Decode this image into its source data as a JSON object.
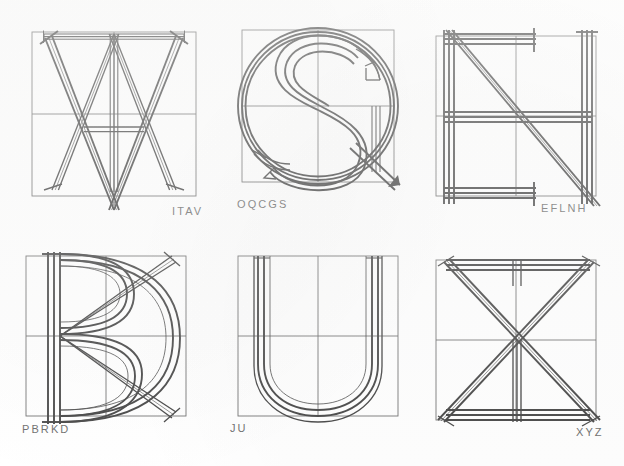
{
  "page": {
    "kind": "letterform-construction-plate",
    "background_color": "#ffffff",
    "ink_color": "#1a1a1a",
    "guide_color": "#4d4d4d",
    "label_color": "#4a4a4a",
    "columns": 3,
    "rows": 2,
    "total_figures": 6
  },
  "figures": [
    {
      "id": "fig-itav",
      "label": "ITAV",
      "letters": [
        "I",
        "T",
        "A",
        "V"
      ],
      "position": "top-left",
      "description": "Superimposed capitals I, T, A and V constructed on a square grid with halving guide lines"
    },
    {
      "id": "fig-oqcgs",
      "label": "OQCGS",
      "letters": [
        "O",
        "Q",
        "C",
        "G",
        "S"
      ],
      "position": "top-centre",
      "description": "Superimposed round capitals O, Q, C, G and S inscribed in the square"
    },
    {
      "id": "fig-eflnh",
      "label": "EFLNH",
      "letters": [
        "E",
        "F",
        "L",
        "N",
        "H"
      ],
      "position": "top-right",
      "description": "Superimposed rectilinear capitals E, F, L, N and H on the square grid"
    },
    {
      "id": "fig-pbrkd",
      "label": "PBRKD",
      "letters": [
        "P",
        "B",
        "R",
        "K",
        "D"
      ],
      "position": "bottom-left",
      "description": "Superimposed capitals P, B, R, K and D sharing a common left stem"
    },
    {
      "id": "fig-ju",
      "label": "JU",
      "letters": [
        "J",
        "U"
      ],
      "position": "bottom-centre",
      "description": "Superimposed capitals J and U with a common rounded bowl"
    },
    {
      "id": "fig-xyz",
      "label": "XYZ",
      "letters": [
        "X",
        "Y",
        "Z"
      ],
      "position": "bottom-right",
      "description": "Superimposed capitals X, Y and Z built on the square diagonals"
    }
  ],
  "labels": {
    "itav": "ITAV",
    "oqcgs": "OQCGS",
    "eflnh": "EFLNH",
    "pbrkd": "PBRKD",
    "ju": "JU",
    "xyz": "XYZ"
  }
}
